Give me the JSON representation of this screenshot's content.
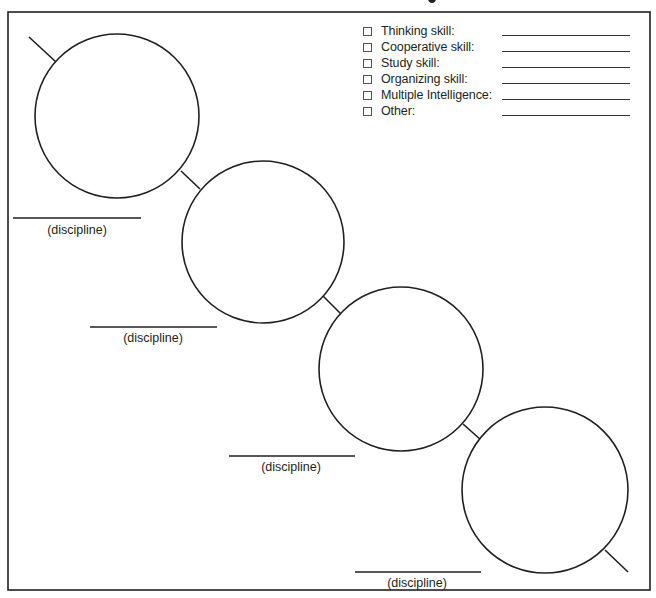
{
  "page": {
    "title_fragment": "g"
  },
  "checklist": {
    "items": [
      {
        "label": "Thinking skill:",
        "checked": false,
        "value": ""
      },
      {
        "label": "Cooperative skill:",
        "checked": false,
        "value": ""
      },
      {
        "label": "Study skill:",
        "checked": false,
        "value": ""
      },
      {
        "label": "Organizing skill:",
        "checked": false,
        "value": ""
      },
      {
        "label": "Multiple Intelligence:",
        "checked": false,
        "value": ""
      },
      {
        "label": "Other:",
        "checked": false,
        "value": ""
      }
    ]
  },
  "chain": {
    "circles": [
      {
        "id": 1,
        "discipline_label": "(discipline)",
        "discipline_value": ""
      },
      {
        "id": 2,
        "discipline_label": "(discipline)",
        "discipline_value": ""
      },
      {
        "id": 3,
        "discipline_label": "(discipline)",
        "discipline_value": ""
      },
      {
        "id": 4,
        "discipline_label": "(discipline)",
        "discipline_value": ""
      }
    ]
  },
  "colors": {
    "stroke": "#231f20",
    "background": "#ffffff"
  }
}
